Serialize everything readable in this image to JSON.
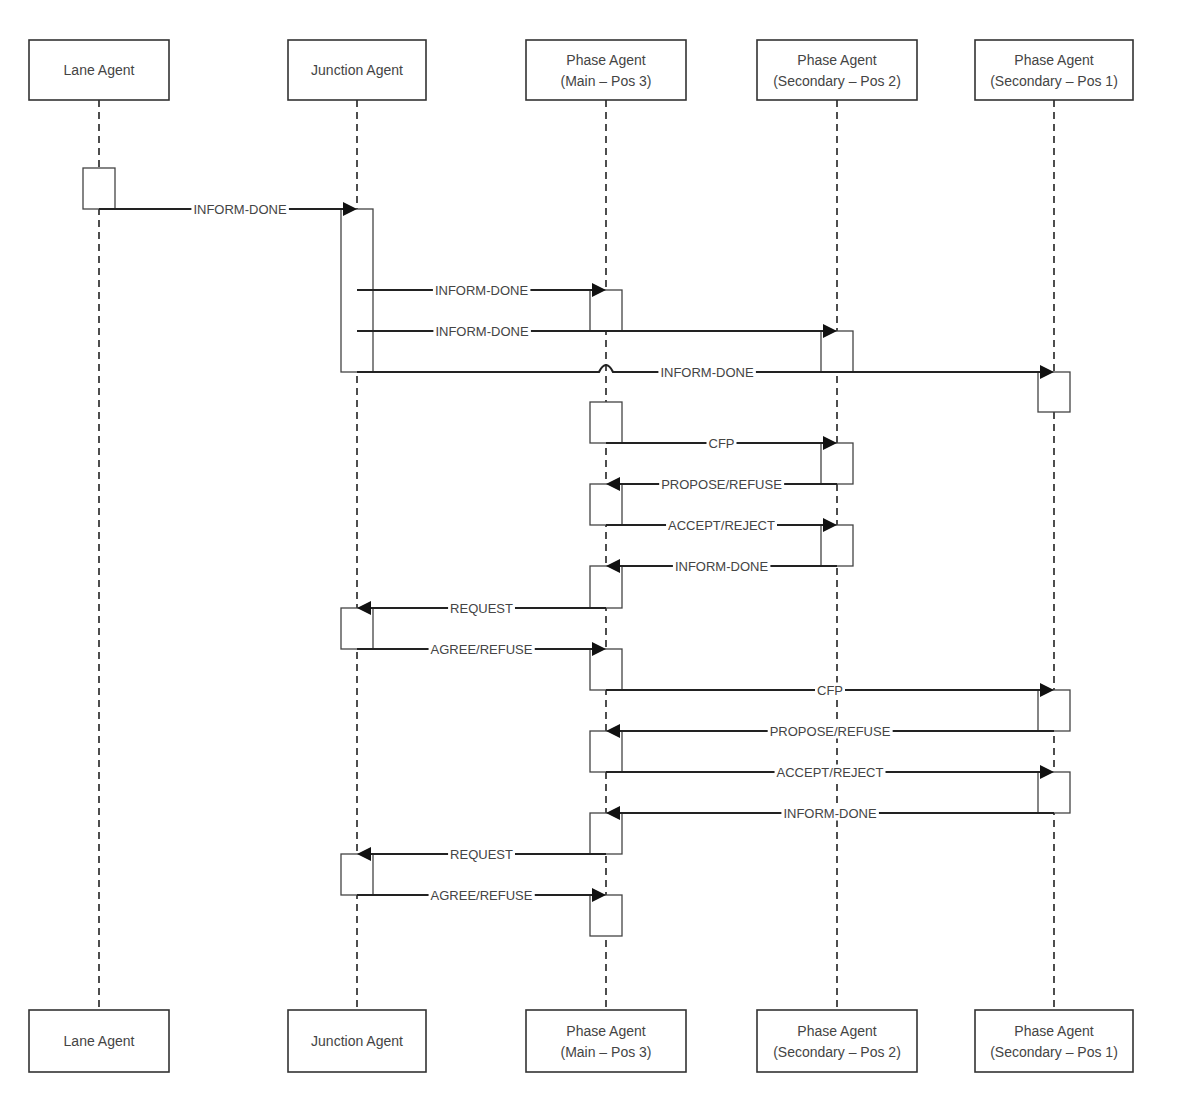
{
  "diagram": {
    "type": "sequence-diagram",
    "agents": [
      {
        "id": "lane",
        "lines": [
          "Lane Agent"
        ]
      },
      {
        "id": "junction",
        "lines": [
          "Junction Agent"
        ]
      },
      {
        "id": "main3",
        "lines": [
          "Phase Agent",
          "(Main – Pos 3)"
        ]
      },
      {
        "id": "sec2",
        "lines": [
          "Phase Agent",
          "(Secondary – Pos 2)"
        ]
      },
      {
        "id": "sec1",
        "lines": [
          "Phase Agent",
          "(Secondary – Pos 1)"
        ]
      }
    ],
    "messages": [
      {
        "from": "lane",
        "to": "junction",
        "label": "INFORM-DONE"
      },
      {
        "from": "junction",
        "to": "main3",
        "label": "INFORM-DONE"
      },
      {
        "from": "junction",
        "to": "sec2",
        "label": "INFORM-DONE"
      },
      {
        "from": "junction",
        "to": "sec1",
        "label": "INFORM-DONE"
      },
      {
        "from": "main3",
        "to": "sec2",
        "label": "CFP"
      },
      {
        "from": "sec2",
        "to": "main3",
        "label": "PROPOSE/REFUSE"
      },
      {
        "from": "main3",
        "to": "sec2",
        "label": "ACCEPT/REJECT"
      },
      {
        "from": "sec2",
        "to": "main3",
        "label": "INFORM-DONE"
      },
      {
        "from": "main3",
        "to": "junction",
        "label": "REQUEST"
      },
      {
        "from": "junction",
        "to": "main3",
        "label": "AGREE/REFUSE"
      },
      {
        "from": "main3",
        "to": "sec1",
        "label": "CFP"
      },
      {
        "from": "sec1",
        "to": "main3",
        "label": "PROPOSE/REFUSE"
      },
      {
        "from": "main3",
        "to": "sec1",
        "label": "ACCEPT/REJECT"
      },
      {
        "from": "sec1",
        "to": "main3",
        "label": "INFORM-DONE"
      },
      {
        "from": "main3",
        "to": "junction",
        "label": "REQUEST"
      },
      {
        "from": "junction",
        "to": "main3",
        "label": "AGREE/REFUSE"
      }
    ]
  }
}
